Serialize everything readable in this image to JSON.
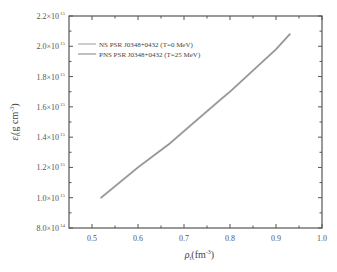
{
  "chart_data": {
    "type": "line",
    "title": "",
    "xlabel": "ρ_t (fm^-3)",
    "ylabel": "ε_t (g cm^-3)",
    "xlim": [
      0.45,
      1.0
    ],
    "ylim": [
      800000000000000.0,
      2200000000000000.0
    ],
    "grid": false,
    "legend_position": "upper left",
    "x_ticks": [
      0.5,
      0.6,
      0.7,
      0.8,
      0.9,
      1.0
    ],
    "x_tick_labels": [
      "0.5",
      "0.6",
      "0.7",
      "0.8",
      "0.9",
      "1.0"
    ],
    "y_ticks": [
      800000000000000.0,
      1000000000000000.0,
      1200000000000000.0,
      1400000000000000.0,
      1600000000000000.0,
      1800000000000000.0,
      2000000000000000.0,
      2200000000000000.0
    ],
    "y_tick_labels": [
      {
        "mantissa": "8.0×10",
        "exp": "14"
      },
      {
        "mantissa": "1.0×10",
        "exp": "15"
      },
      {
        "mantissa": "1.2×10",
        "exp": "15"
      },
      {
        "mantissa": "1.4×10",
        "exp": "15"
      },
      {
        "mantissa": "1.6×10",
        "exp": "15"
      },
      {
        "mantissa": "1.8×10",
        "exp": "15"
      },
      {
        "mantissa": "2.0×10",
        "exp": "15"
      },
      {
        "mantissa": "2.2×10",
        "exp": "15"
      }
    ],
    "series": [
      {
        "name": "NS PSR J0348+0432 (T=0 MeV)",
        "color": "#c8c8c8",
        "x": [
          0.52,
          0.6,
          0.67,
          0.7,
          0.78,
          0.8,
          0.9,
          0.93
        ],
        "y": [
          1000000000000000.0,
          1200000000000000.0,
          1360000000000000.0,
          1440000000000000.0,
          1650000000000000.0,
          1700000000000000.0,
          1980000000000000.0,
          2080000000000000.0
        ]
      },
      {
        "name": "PNS PSR J0348+0432 (T=25 MeV)",
        "color": "#8a8a8a",
        "x": [
          0.52,
          0.6,
          0.67,
          0.7,
          0.78,
          0.8,
          0.9,
          0.93
        ],
        "y": [
          1000000000000000.0,
          1200000000000000.0,
          1360000000000000.0,
          1440000000000000.0,
          1650000000000000.0,
          1700000000000000.0,
          1980000000000000.0,
          2080000000000000.0
        ]
      }
    ]
  },
  "axes": {
    "xlabel_main": "ρ",
    "xlabel_sub": "t",
    "xlabel_unit": "(fm",
    "xlabel_unit_exp": "-3",
    "xlabel_close": ")",
    "ylabel_main": "ε",
    "ylabel_sub": "t",
    "ylabel_unit": "(g  cm",
    "ylabel_unit_exp": "-3",
    "ylabel_close": ")"
  },
  "legend": {
    "items": [
      {
        "label": "NS PSR J0348+0432 (T=0 MeV)",
        "color": "#c8c8c8"
      },
      {
        "label": "PNS PSR J0348+0432 (T=25 MeV)",
        "color": "#8a8a8a"
      }
    ]
  }
}
